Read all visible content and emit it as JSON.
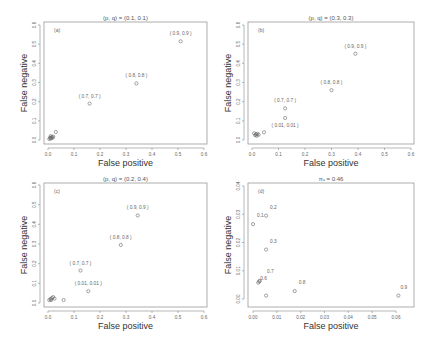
{
  "chart_data": [
    {
      "id": "a",
      "type": "scatter",
      "panel_label": "(a)",
      "title": "(p, q) = (0.1, 0.1)",
      "xlabel": "False positive",
      "ylabel": "False negative",
      "xlim": [
        0,
        0.6
      ],
      "ylim": [
        0,
        0.6
      ],
      "xticks": [
        "0.0",
        "0.1",
        "0.2",
        "0.3",
        "0.4",
        "0.5",
        "0.6"
      ],
      "yticks": [
        "0.0",
        "0.1",
        "0.2",
        "0.3",
        "0.4",
        "0.5",
        "0.6"
      ],
      "grid": false,
      "points": [
        {
          "x": 0.005,
          "y": 0.005
        },
        {
          "x": 0.008,
          "y": 0.01
        },
        {
          "x": 0.01,
          "y": 0.012
        },
        {
          "x": 0.012,
          "y": 0.008
        },
        {
          "x": 0.015,
          "y": 0.015
        },
        {
          "x": 0.018,
          "y": 0.012
        },
        {
          "x": 0.02,
          "y": 0.018
        },
        {
          "x": 0.01,
          "y": 0.02
        },
        {
          "x": 0.03,
          "y": 0.042
        },
        {
          "x": 0.16,
          "y": 0.19,
          "label": "( 0.7, 0.7 )"
        },
        {
          "x": 0.34,
          "y": 0.295,
          "label": "( 0.8, 0.8 )"
        },
        {
          "x": 0.51,
          "y": 0.515,
          "label": "( 0.9, 0.9 )"
        }
      ]
    },
    {
      "id": "b",
      "type": "scatter",
      "panel_label": "(b)",
      "title": "(p, q) = (0.3, 0.3)",
      "xlabel": "False positive",
      "ylabel": "False negative",
      "xlim": [
        0,
        0.6
      ],
      "ylim": [
        0,
        0.6
      ],
      "xticks": [
        "0.0",
        "0.1",
        "0.2",
        "0.3",
        "0.4",
        "0.5",
        "0.6"
      ],
      "yticks": [
        "0.0",
        "0.1",
        "0.2",
        "0.3",
        "0.4",
        "0.5",
        "0.6"
      ],
      "grid": false,
      "points": [
        {
          "x": 0.008,
          "y": 0.035
        },
        {
          "x": 0.012,
          "y": 0.025
        },
        {
          "x": 0.015,
          "y": 0.03
        },
        {
          "x": 0.018,
          "y": 0.022
        },
        {
          "x": 0.02,
          "y": 0.032
        },
        {
          "x": 0.025,
          "y": 0.028
        },
        {
          "x": 0.045,
          "y": 0.04
        },
        {
          "x": 0.125,
          "y": 0.115,
          "label": "( 0.01, 0.01 )",
          "label_below": true
        },
        {
          "x": 0.125,
          "y": 0.165,
          "label": "( 0.7, 0.7 )"
        },
        {
          "x": 0.3,
          "y": 0.26,
          "label": "( 0.8, 0.8 )"
        },
        {
          "x": 0.39,
          "y": 0.45,
          "label": "( 0.9, 0.9 )"
        }
      ]
    },
    {
      "id": "c",
      "type": "scatter",
      "panel_label": "(c)",
      "title": "(p, q) = (0.2, 0.4)",
      "xlabel": "False positive",
      "ylabel": "False negative",
      "xlim": [
        0,
        0.6
      ],
      "ylim": [
        0,
        0.6
      ],
      "xticks": [
        "0.0",
        "0.1",
        "0.2",
        "0.3",
        "0.4",
        "0.5",
        "0.6"
      ],
      "yticks": [
        "0.0",
        "0.1",
        "0.2",
        "0.3",
        "0.4",
        "0.5",
        "0.6"
      ],
      "grid": false,
      "points": [
        {
          "x": 0.005,
          "y": 0.015
        },
        {
          "x": 0.01,
          "y": 0.02
        },
        {
          "x": 0.012,
          "y": 0.015
        },
        {
          "x": 0.015,
          "y": 0.025
        },
        {
          "x": 0.02,
          "y": 0.03
        },
        {
          "x": 0.025,
          "y": 0.022
        },
        {
          "x": 0.06,
          "y": 0.015
        },
        {
          "x": 0.155,
          "y": 0.06,
          "label": "( 0.01, 0.01 )"
        },
        {
          "x": 0.125,
          "y": 0.165,
          "label": "( 0.7, 0.7 )"
        },
        {
          "x": 0.28,
          "y": 0.295,
          "label": "( 0.8, 0.8 )"
        },
        {
          "x": 0.345,
          "y": 0.445,
          "label": "( 0.9, 0.9 )"
        }
      ]
    },
    {
      "id": "d",
      "type": "scatter",
      "panel_label": "(d)",
      "title": "π_s = 0.46",
      "xlabel": "False positive",
      "ylabel": "False negative",
      "xlim": [
        0,
        0.06
      ],
      "ylim": [
        0,
        0.04
      ],
      "xticks": [
        "0.00",
        "0.01",
        "0.02",
        "0.03",
        "0.04",
        "0.05",
        "0.06"
      ],
      "yticks": [
        "0.00",
        "0.01",
        "0.02",
        "0.03",
        "0.04"
      ],
      "grid": false,
      "points": [
        {
          "x": 0.0,
          "y": 0.0265,
          "label": "0.1"
        },
        {
          "x": 0.0055,
          "y": 0.0295,
          "label": "0.2"
        },
        {
          "x": 0.0055,
          "y": 0.0175,
          "label": "0.3"
        },
        {
          "x": 0.0022,
          "y": 0.0058,
          "label": "0.4"
        },
        {
          "x": 0.0028,
          "y": 0.0064,
          "label": "0.5"
        },
        {
          "x": 0.0026,
          "y": 0.0062,
          "label": "0.6"
        },
        {
          "x": 0.0055,
          "y": 0.0012,
          "label": "0.7"
        },
        {
          "x": 0.0175,
          "y": 0.0028,
          "label": "0.8"
        },
        {
          "x": 0.061,
          "y": 0.0012,
          "label": "0.9"
        }
      ]
    }
  ],
  "layout": {
    "panels": {
      "a": {
        "x0": 48,
        "x1": 204,
        "y0": 140,
        "y1": 25,
        "box": [
          44,
          22,
          207,
          144
        ]
      },
      "b": {
        "x0": 252,
        "x1": 411,
        "y0": 140,
        "y1": 25,
        "box": [
          248,
          22,
          414,
          144
        ]
      },
      "c": {
        "x0": 48,
        "x1": 204,
        "y0": 303,
        "y1": 185,
        "box": [
          44,
          183,
          207,
          307
        ]
      },
      "d": {
        "x0": 253,
        "x1": 396,
        "y0": 299,
        "y1": 186,
        "box": [
          248,
          183,
          414,
          307
        ]
      }
    }
  }
}
